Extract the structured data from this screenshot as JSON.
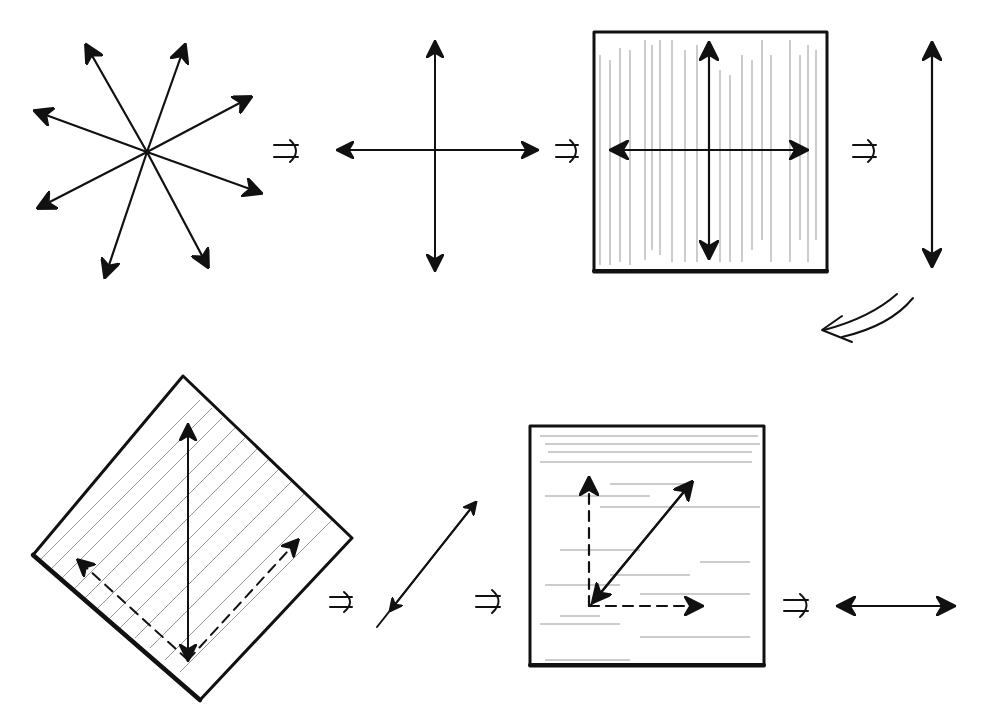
{
  "title": "Polarization of light through polarizing filters",
  "colors": {
    "ink": "#111111",
    "background": "#ffffff",
    "hatching": "#444444"
  },
  "stages": [
    {
      "id": "unpolarized",
      "description": "Unpolarized light: arrows in eight directions radiating from a center"
    },
    {
      "id": "components",
      "description": "Light resolved into vertical and horizontal components"
    },
    {
      "id": "vertical-filter",
      "description": "Square filter with vertical hatching; vertical and horizontal double arrows"
    },
    {
      "id": "vertical-polarized",
      "description": "Only vertical double arrow remains"
    },
    {
      "id": "diagonal-filter",
      "description": "Diamond (45° rotated) filter with diagonal hatching; vertical arrow resolved into dashed components"
    },
    {
      "id": "diagonal-polarized",
      "description": "Diagonal double arrow remains"
    },
    {
      "id": "horizontal-filter",
      "description": "Square filter with horizontal hatching; diagonal arrow resolved into dashed vertical and horizontal components"
    },
    {
      "id": "horizontal-polarized",
      "description": "Only horizontal double arrow remains"
    }
  ],
  "transition_symbol": "⇒",
  "transitions": 6,
  "curved_transition": "double curved arrow from top row to bottom row"
}
